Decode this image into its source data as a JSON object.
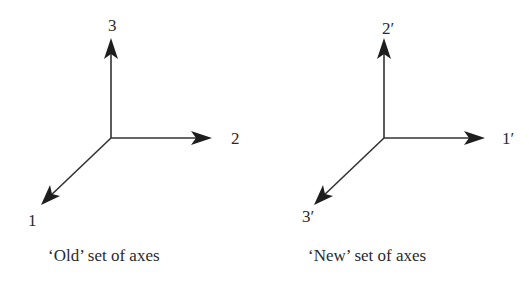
{
  "diagram": {
    "colors": {
      "line": "#333333",
      "arrowhead": "#1e1e1e",
      "text": "#2a2a2a",
      "background": "#ffffff"
    },
    "panels": [
      {
        "id": "old",
        "caption": "‘Old’ set of axes",
        "origin": [
          111,
          138
        ],
        "axes": [
          {
            "label": "3",
            "direction": "up",
            "tip": [
              111,
              40
            ],
            "label_pos": [
              113,
              30
            ]
          },
          {
            "label": "2",
            "direction": "right",
            "tip": [
              211,
              138
            ],
            "label_pos": [
              236,
              144
            ]
          },
          {
            "label": "1",
            "direction": "down-left",
            "tip": [
              41,
              205
            ],
            "label_pos": [
              32,
              224
            ]
          }
        ]
      },
      {
        "id": "new",
        "caption": "‘New’ set of axes",
        "origin": [
          384,
          138
        ],
        "axes": [
          {
            "label": "2′",
            "direction": "up",
            "tip": [
              384,
              40
            ],
            "label_pos": [
              390,
              33
            ]
          },
          {
            "label": "1′",
            "direction": "right",
            "tip": [
              484,
              138
            ],
            "label_pos": [
              507,
              144
            ]
          },
          {
            "label": "3′",
            "direction": "down-left",
            "tip": [
              314,
              205
            ],
            "label_pos": [
              307,
              220
            ]
          }
        ]
      }
    ]
  }
}
